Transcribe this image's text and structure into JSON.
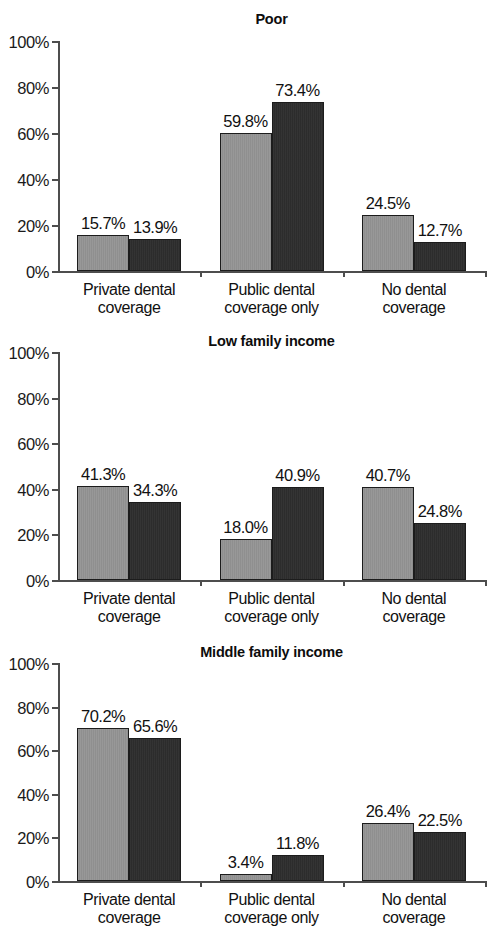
{
  "figure": {
    "background": "#ffffff",
    "series_colors": {
      "series_a": "#949494",
      "series_b": "#2d2d2d"
    },
    "axis_color": "#4d4d4d",
    "categories": [
      "Private dental\ncoverage",
      "Public dental\ncoverage only",
      "No dental\ncoverage"
    ],
    "ytick_labels": [
      "0%",
      "20%",
      "40%",
      "60%",
      "80%",
      "100%"
    ],
    "ytick_values": [
      0,
      20,
      40,
      60,
      80,
      100
    ]
  },
  "chart_data": [
    {
      "type": "bar",
      "title": "Poor",
      "categories": [
        "Private dental coverage",
        "Public dental coverage only",
        "No dental coverage"
      ],
      "series": [
        {
          "name": "series-a",
          "values": [
            15.7,
            59.8,
            24.5
          ],
          "labels": [
            "15.7%",
            "59.8%",
            "24.5%"
          ]
        },
        {
          "name": "series-b",
          "values": [
            13.9,
            73.4,
            12.7
          ],
          "labels": [
            "13.9%",
            "73.4%",
            "12.7%"
          ]
        }
      ],
      "xlabel": "",
      "ylabel": "",
      "ylim": [
        0,
        100
      ],
      "yticks": [
        0,
        20,
        40,
        60,
        80,
        100
      ],
      "ytick_labels": [
        "0%",
        "20%",
        "40%",
        "60%",
        "80%",
        "100%"
      ],
      "grid": false,
      "legend": "none"
    },
    {
      "type": "bar",
      "title": "Low family income",
      "categories": [
        "Private dental coverage",
        "Public dental coverage only",
        "No dental coverage"
      ],
      "series": [
        {
          "name": "series-a",
          "values": [
            41.3,
            18.0,
            40.7
          ],
          "labels": [
            "41.3%",
            "18.0%",
            "40.7%"
          ]
        },
        {
          "name": "series-b",
          "values": [
            34.3,
            40.9,
            24.8
          ],
          "labels": [
            "34.3%",
            "40.9%",
            "24.8%"
          ]
        }
      ],
      "xlabel": "",
      "ylabel": "",
      "ylim": [
        0,
        100
      ],
      "yticks": [
        0,
        20,
        40,
        60,
        80,
        100
      ],
      "ytick_labels": [
        "0%",
        "20%",
        "40%",
        "60%",
        "80%",
        "100%"
      ],
      "grid": false,
      "legend": "none"
    },
    {
      "type": "bar",
      "title": "Middle family income",
      "categories": [
        "Private dental coverage",
        "Public dental coverage only",
        "No dental coverage"
      ],
      "series": [
        {
          "name": "series-a",
          "values": [
            70.2,
            3.4,
            26.4
          ],
          "labels": [
            "70.2%",
            "3.4%",
            "26.4%"
          ]
        },
        {
          "name": "series-b",
          "values": [
            65.6,
            11.8,
            22.5
          ],
          "labels": [
            "65.6%",
            "11.8%",
            "22.5%"
          ]
        }
      ],
      "xlabel": "",
      "ylabel": "",
      "ylim": [
        0,
        100
      ],
      "yticks": [
        0,
        20,
        40,
        60,
        80,
        100
      ],
      "ytick_labels": [
        "0%",
        "20%",
        "40%",
        "60%",
        "80%",
        "100%"
      ],
      "grid": false,
      "legend": "none"
    }
  ]
}
